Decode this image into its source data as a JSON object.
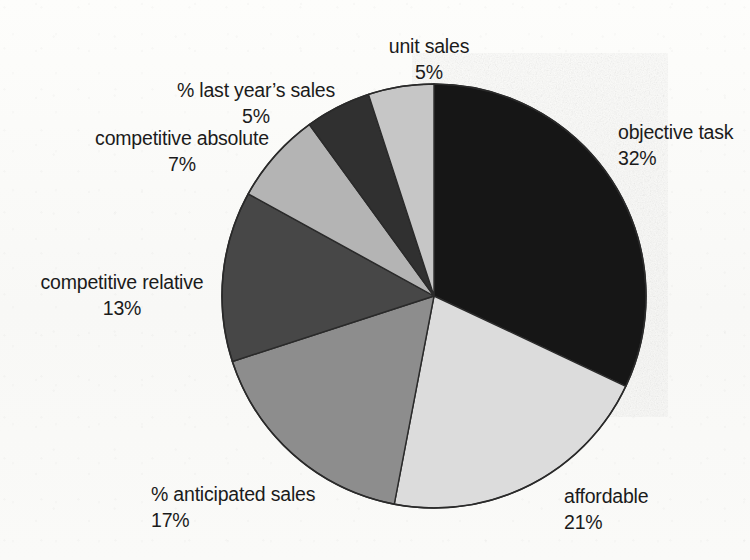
{
  "figure": {
    "background_color": "#fbfbf9",
    "text_color": "#1b1b1b",
    "outline_color": "#2a2a2a"
  },
  "chart_data": {
    "type": "pie",
    "title": "",
    "subtitle": "",
    "xlabel": "",
    "ylabel": "",
    "grid": false,
    "legend_position": "none",
    "label_format": "name above, percent below",
    "start_angle_deg": 0,
    "direction": "clockwise",
    "center": {
      "x": 434,
      "y": 296
    },
    "radius": 212,
    "categories": [
      "objective task",
      "affordable",
      "% anticipated sales",
      "competitive relative",
      "competitive absolute",
      "% last year’s sales",
      "unit sales"
    ],
    "values": [
      32,
      21,
      17,
      13,
      7,
      5,
      5
    ],
    "value_labels": [
      "32%",
      "21%",
      "17%",
      "13%",
      "7%",
      "5%",
      "5%"
    ],
    "colors": [
      "#151515",
      "#dcdcdc",
      "#8d8d8d",
      "#474747",
      "#b4b4b4",
      "#303030",
      "#c6c6c6"
    ],
    "total": 100,
    "slices": [
      {
        "name": "objective task",
        "value": 32,
        "value_label": "32%",
        "color": "#151515",
        "start_deg": 0,
        "end_deg": 115.2,
        "label": {
          "x": 618,
          "y": 120,
          "align": "left"
        }
      },
      {
        "name": "affordable",
        "value": 21,
        "value_label": "21%",
        "color": "#dcdcdc",
        "start_deg": 115.2,
        "end_deg": 190.8,
        "label": {
          "x": 564,
          "y": 484,
          "align": "left"
        }
      },
      {
        "name": "% anticipated sales",
        "value": 17,
        "value_label": "17%",
        "color": "#8d8d8d",
        "start_deg": 190.8,
        "end_deg": 252.0,
        "label": {
          "x": 151,
          "y": 482,
          "align": "left"
        }
      },
      {
        "name": "competitive relative",
        "value": 13,
        "value_label": "13%",
        "color": "#474747",
        "start_deg": 252.0,
        "end_deg": 298.8,
        "label": {
          "x": 220,
          "y": 270,
          "align": "right"
        }
      },
      {
        "name": "competitive absolute",
        "value": 7,
        "value_label": "7%",
        "color": "#b4b4b4",
        "start_deg": 298.8,
        "end_deg": 324.0,
        "label": {
          "x": 287,
          "y": 126,
          "align": "right"
        }
      },
      {
        "name": "% last year’s sales",
        "value": 5,
        "value_label": "5%",
        "color": "#303030",
        "start_deg": 324.0,
        "end_deg": 342.0,
        "label": {
          "x": 346,
          "y": 78,
          "align": "right"
        }
      },
      {
        "name": "unit sales",
        "value": 5,
        "value_label": "5%",
        "color": "#c6c6c6",
        "start_deg": 342.0,
        "end_deg": 360.0,
        "label": {
          "x": 429,
          "y": 34,
          "align": "center"
        }
      }
    ]
  }
}
